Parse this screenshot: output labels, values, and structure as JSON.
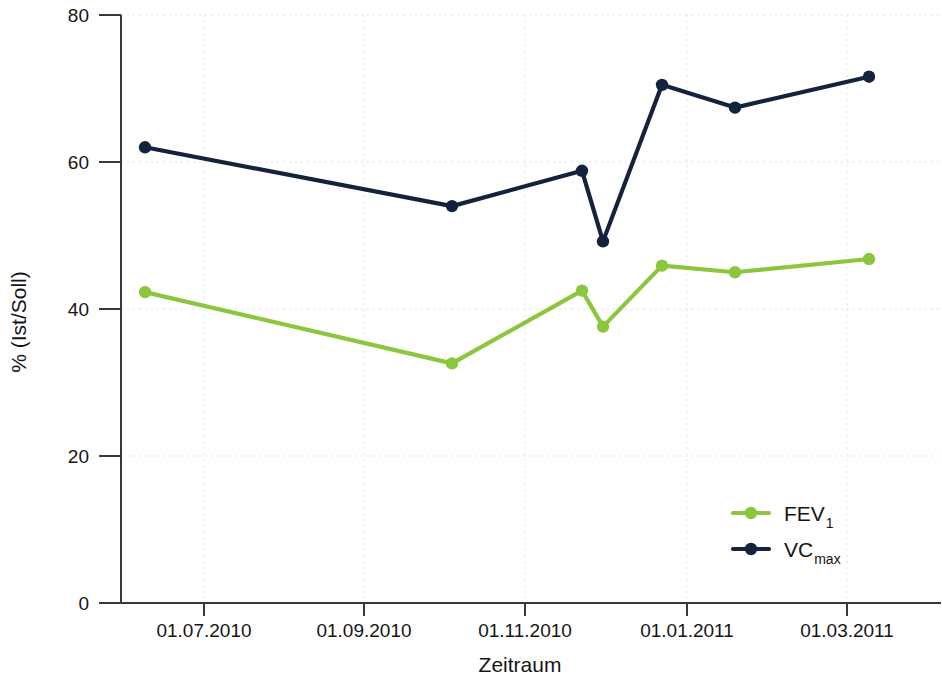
{
  "chart_data": {
    "type": "line",
    "title": "",
    "xlabel": "Zeitraum",
    "ylabel": "% (Ist/Soll)",
    "ylim": [
      0,
      80
    ],
    "yticks": [
      0,
      20,
      40,
      60,
      80
    ],
    "ytick_labels": [
      "0",
      "20",
      "40",
      "60",
      "80"
    ],
    "xlim": [
      "2010-06-01",
      "2011-03-20"
    ],
    "xticks": [
      "2010-07-01",
      "2010-09-01",
      "2010-11-01",
      "2011-01-01",
      "2011-03-01"
    ],
    "xtick_labels": [
      "01.07.2010",
      "01.09.2010",
      "01.11.2010",
      "01.01.2011",
      "01.03.2011"
    ],
    "grid": true,
    "grid_color": "#cfe8ef",
    "legend_position": "inside bottom-right",
    "x": [
      "2010-06-15",
      "2010-10-01",
      "2010-11-17",
      "2010-12-01",
      "2010-12-23",
      "2011-01-18",
      "2011-03-08"
    ],
    "series": [
      {
        "name": "FEV1",
        "label": "FEV",
        "sublabel": "1",
        "color": "#8CC63E",
        "marker": "circle",
        "values": [
          42.3,
          32.6,
          42.5,
          37.6,
          45.9,
          45.0,
          46.8
        ]
      },
      {
        "name": "VCmax",
        "label": "VC",
        "sublabel": "max",
        "color": "#14233C",
        "marker": "circle",
        "values": [
          62.0,
          54.0,
          58.8,
          49.2,
          70.5,
          67.4,
          71.6
        ]
      }
    ]
  },
  "axes": {
    "y_title": "% (Ist/Soll)",
    "x_title": "Zeitraum"
  },
  "legend": {
    "entries": [
      {
        "label": "FEV",
        "sub": "1",
        "color": "#8CC63E"
      },
      {
        "label": "VC",
        "sub": "max",
        "color": "#14233C"
      }
    ]
  },
  "geometry": {
    "plot_left": 121,
    "plot_right": 942,
    "plot_top": 15,
    "plot_bottom": 603,
    "y_min": 0,
    "y_max": 80,
    "x_pixels": [
      145,
      452,
      582,
      603,
      662,
      735,
      869
    ],
    "xtick_pixels": [
      204,
      364,
      525,
      687,
      847
    ]
  }
}
